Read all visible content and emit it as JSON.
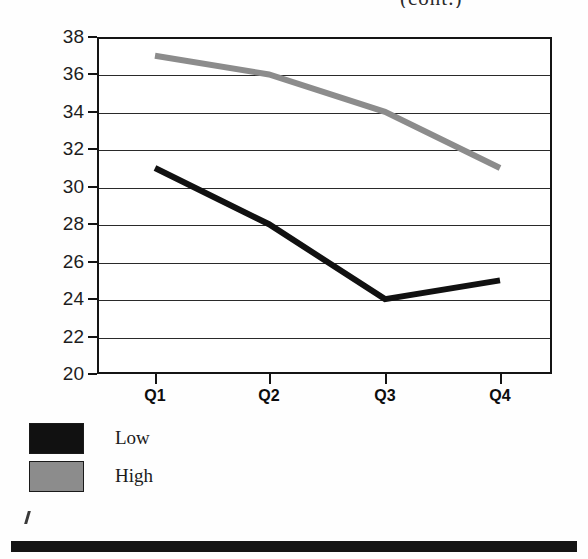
{
  "document": {
    "title_fragment": "(cont.)",
    "background": "#fefefe"
  },
  "colors": {
    "low_series": "#111111",
    "high_series": "#8c8c8c",
    "axis": "#141414",
    "gridline": "#2a2a2a",
    "bottom_bar": "#151515"
  },
  "legend": {
    "position": "below-plot-left",
    "items": [
      {
        "label": "Low",
        "swatch_color": "#111111"
      },
      {
        "label": "High",
        "swatch_color": "#8c8c8c"
      }
    ]
  },
  "chart_data": {
    "type": "line",
    "title": "(cont.)",
    "xlabel": "",
    "ylabel": "",
    "categories": [
      "Q1",
      "Q2",
      "Q3",
      "Q4"
    ],
    "series": [
      {
        "name": "Low",
        "values": [
          31,
          28,
          24,
          25
        ],
        "color": "#111111"
      },
      {
        "name": "High",
        "values": [
          37,
          36,
          34,
          31
        ],
        "color": "#8c8c8c"
      }
    ],
    "ylim": [
      20,
      38
    ],
    "yticks": [
      20,
      22,
      24,
      26,
      28,
      30,
      32,
      34,
      36,
      38
    ],
    "ytick_labels": [
      "20",
      "22",
      "24",
      "26",
      "28",
      "30",
      "32",
      "34",
      "36",
      "38"
    ],
    "xtick_labels": [
      "Q1",
      "Q2",
      "Q3",
      "Q4"
    ],
    "grid": true,
    "grid_axis": "y",
    "legend_entries": [
      "Low",
      "High"
    ],
    "legend_position": "bottom-left"
  }
}
